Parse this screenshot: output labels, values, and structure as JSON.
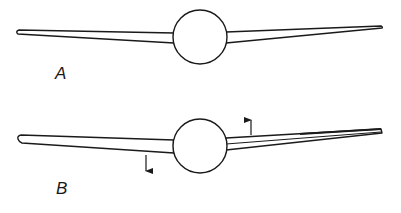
{
  "figure": {
    "panels": [
      {
        "id": "A",
        "label": "A",
        "hub": {
          "cx": 200,
          "cy": 37,
          "r": 27
        },
        "left_blade": {
          "tip": [
            17,
            32
          ],
          "root_top": [
            174,
            33
          ],
          "root_bottom": [
            174,
            43
          ]
        },
        "right_blade": {
          "tip": [
            382,
            27
          ],
          "root_top": [
            226,
            32
          ],
          "root_bottom": [
            226,
            43
          ]
        },
        "arrows": []
      },
      {
        "id": "B",
        "label": "B",
        "hub": {
          "cx": 200,
          "cy": 146,
          "r": 27
        },
        "left_blade": {
          "tip": [
            18,
            139
          ],
          "root_top": [
            174,
            140
          ],
          "root_bottom": [
            174,
            153
          ]
        },
        "right_blade": {
          "tip": [
            382,
            131
          ],
          "root_top": [
            226,
            138
          ],
          "root_bottom": [
            226,
            150
          ],
          "twisted": true
        },
        "arrows": [
          {
            "direction": "down",
            "x": 146,
            "y_start": 155,
            "y_end": 172
          },
          {
            "direction": "up",
            "x": 251,
            "y_start": 135,
            "y_end": 119
          }
        ]
      }
    ],
    "colors": {
      "stroke": "#1a1a1a",
      "background": "#ffffff"
    }
  }
}
